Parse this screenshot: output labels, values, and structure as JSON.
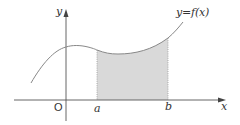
{
  "diagram": {
    "type": "definite-integral-area",
    "labels": {
      "y_axis": "y",
      "x_axis": "x",
      "origin": "O",
      "lower_bound": "a",
      "upper_bound": "b",
      "function": "y=f(x)"
    },
    "colors": {
      "axis": "#555555",
      "curve": "#888888",
      "shade": "#d9d9d9",
      "bound_line": "#999999",
      "text": "#333333"
    },
    "shaded_region": {
      "from": "a",
      "to": "b",
      "between": "curve and x-axis"
    }
  }
}
